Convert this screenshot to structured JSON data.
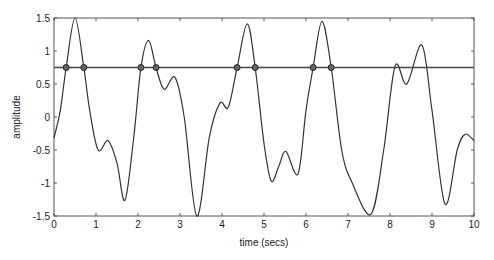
{
  "chart_data": {
    "type": "line",
    "title": "",
    "xlabel": "time (secs)",
    "ylabel": "amplitude",
    "xlim": [
      0,
      10
    ],
    "ylim": [
      -1.5,
      1.5
    ],
    "grid": false,
    "legend": null,
    "x_ticks": [
      "0",
      "1",
      "2",
      "3",
      "4",
      "5",
      "6",
      "7",
      "8",
      "9",
      "10"
    ],
    "y_ticks": [
      "-1.5",
      "-1",
      "-0.5",
      "0",
      "0.5",
      "1",
      "1.5"
    ],
    "series": [
      {
        "name": "signal",
        "color": "#333333",
        "x": [
          0,
          0.15,
          0.29,
          0.5,
          0.71,
          0.85,
          1.05,
          1.29,
          1.5,
          1.69,
          1.9,
          2.07,
          2.25,
          2.43,
          2.62,
          2.88,
          3.1,
          3.4,
          3.7,
          3.95,
          4.15,
          4.36,
          4.6,
          4.79,
          5.0,
          5.17,
          5.35,
          5.52,
          5.81,
          6.0,
          6.17,
          6.38,
          6.6,
          6.85,
          7.1,
          7.55,
          7.85,
          8.12,
          8.4,
          8.76,
          9.0,
          9.31,
          9.6,
          9.79,
          10.0
        ],
        "y": [
          -0.32,
          0.1,
          0.75,
          1.5,
          0.75,
          0.1,
          -0.5,
          -0.36,
          -0.7,
          -1.26,
          -0.3,
          0.75,
          1.16,
          0.75,
          0.42,
          0.6,
          0.0,
          -1.5,
          -0.3,
          0.21,
          0.15,
          0.75,
          1.41,
          0.75,
          -0.4,
          -0.97,
          -0.75,
          -0.52,
          -0.86,
          0.1,
          0.75,
          1.45,
          0.75,
          -0.5,
          -1.0,
          -1.47,
          -0.5,
          0.77,
          0.5,
          1.09,
          0.1,
          -1.32,
          -0.5,
          -0.26,
          -0.36
        ]
      },
      {
        "name": "threshold",
        "color": "#333333",
        "x": [
          0,
          10
        ],
        "y": [
          0.75,
          0.75
        ]
      }
    ],
    "markers": {
      "name": "threshold crossings",
      "y": 0.75,
      "x": [
        0.29,
        0.71,
        2.07,
        2.43,
        4.36,
        4.79,
        6.17,
        6.6
      ]
    }
  }
}
